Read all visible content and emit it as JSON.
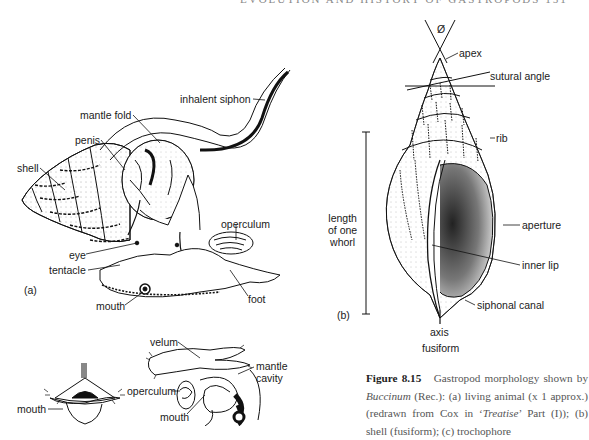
{
  "running_head": "EVOLUTION AND HISTORY OF GASTROPODS 151",
  "panel_a": {
    "label": "(a)",
    "labels": {
      "inhalent_siphon": "inhalent siphon",
      "mantle_fold": "mantle fold",
      "penis": "penis",
      "shell": "shell",
      "operculum": "operculum",
      "eye": "eye",
      "tentacle": "tentacle",
      "mouth": "mouth",
      "foot": "foot"
    }
  },
  "panel_b": {
    "label": "(b)",
    "labels": {
      "angle_symbol": "Ø",
      "apex": "apex",
      "sutural_angle": "sutural angle",
      "rib": "rib",
      "length_of_one_whorl": [
        "length",
        "of one",
        "whorl"
      ],
      "aperture": "aperture",
      "inner_lip": "inner lip",
      "siphonal_canal": "siphonal canal",
      "axis": "axis",
      "fusiform": "fusiform"
    }
  },
  "panel_c": {
    "labels": {
      "mouth_left": "mouth",
      "velum": "velum",
      "mantle_cavity": [
        "mantle",
        "cavity"
      ],
      "operculum": "operculum",
      "mouth_right": "mouth"
    }
  },
  "caption": {
    "figure_number": "Figure 8.15",
    "text_1": "Gastropod morphology shown by ",
    "genus": "Buccinum",
    "text_2": " (Rec.): (a) living animal (x 1 approx.) (redrawn from Cox in ‘",
    "source": "Treatise",
    "text_3": "’ Part (I)); (b) shell (fusiform); (c) trochophore"
  }
}
